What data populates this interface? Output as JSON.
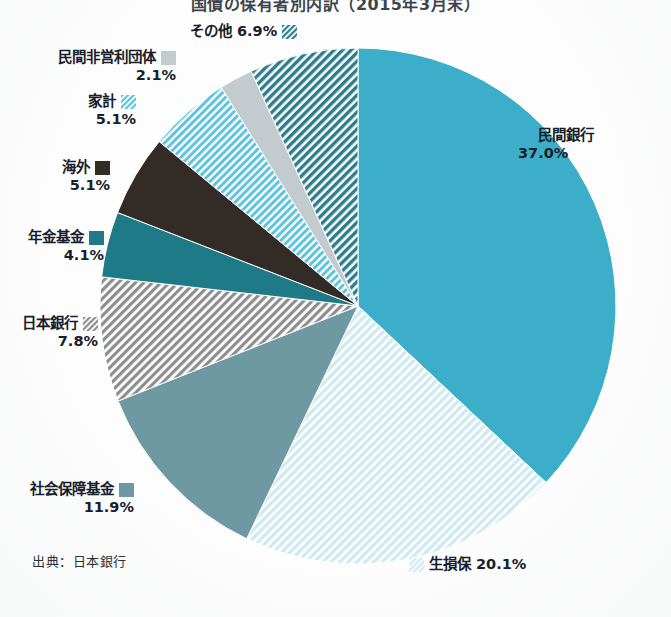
{
  "chart_title": "国債の保有者別内訳（2015年3月末）",
  "source": "出典：日本銀行",
  "colors": {
    "minkan_ginko": "#3CAEC9",
    "seisonpo": "#CFEAF3",
    "shakai_hosho": "#6E99A3",
    "nihon_ginko": "#A8A8A8",
    "nenkin_kikin": "#1F7A88",
    "kaigai": "#332B26",
    "kakei": "#6FC9DF",
    "minkan_hieiri": "#C3CBCE",
    "sonota": "#2E7D8C",
    "text": "#17202A"
  },
  "labels": {
    "sonota": {
      "name": "その他",
      "pct": "6.9%",
      "swatch": "sonota"
    },
    "npo": {
      "name": "民間非営利団体",
      "pct": "2.1%",
      "swatch": "minkan_hieiri"
    },
    "kakei": {
      "name": "家計",
      "pct": "5.1%",
      "swatch": "kakei"
    },
    "kaigai": {
      "name": "海外",
      "pct": "5.1%",
      "swatch": "kaigai"
    },
    "nenkin": {
      "name": "年金基金",
      "pct": "4.1%",
      "swatch": "nenkin_kikin"
    },
    "nichigin": {
      "name": "日本銀行",
      "pct": "7.8%",
      "swatch": "nihon_ginko"
    },
    "shakai": {
      "name": "社会保障基金",
      "pct": "11.9%",
      "swatch": "shakai_hosho"
    },
    "seisonpo": {
      "name": "生損保",
      "pct": "20.1%",
      "swatch": "seisonpo"
    },
    "minkan": {
      "name": "民間銀行",
      "pct": "37.0%",
      "swatch": "minkan_ginko"
    }
  },
  "chart_data": {
    "type": "pie",
    "title": "国債の保有者別内訳（2015年3月末）",
    "source": "出典：日本銀行",
    "unit": "%",
    "legend_position": "around-slices",
    "start_angle_deg": 0,
    "direction": "clockwise",
    "center": {
      "x": 358,
      "y": 306
    },
    "radius": 258,
    "categories": [
      "民間銀行",
      "生損保",
      "社会保障基金",
      "日本銀行",
      "年金基金",
      "海外",
      "家計",
      "民間非営利団体",
      "その他"
    ],
    "values": [
      37.0,
      20.1,
      11.9,
      7.8,
      4.1,
      5.1,
      5.1,
      2.1,
      6.9
    ],
    "slices": [
      {
        "label": "民間銀行",
        "value": 37.0,
        "color": "#3CAEC9",
        "pattern": "solid",
        "start_deg": 0.0,
        "end_deg": 133.2
      },
      {
        "label": "生損保",
        "value": 20.1,
        "color": "#CFEAF3",
        "pattern": "hatch",
        "start_deg": 133.2,
        "end_deg": 205.56
      },
      {
        "label": "社会保障基金",
        "value": 11.9,
        "color": "#6E99A3",
        "pattern": "solid",
        "start_deg": 205.56,
        "end_deg": 248.4
      },
      {
        "label": "日本銀行",
        "value": 7.8,
        "color": "#A8A8A8",
        "pattern": "hatch",
        "start_deg": 248.4,
        "end_deg": 276.48
      },
      {
        "label": "年金基金",
        "value": 4.1,
        "color": "#1F7A88",
        "pattern": "solid",
        "start_deg": 276.48,
        "end_deg": 291.24
      },
      {
        "label": "海外",
        "value": 5.1,
        "color": "#332B26",
        "pattern": "solid",
        "start_deg": 291.24,
        "end_deg": 309.6
      },
      {
        "label": "家計",
        "value": 5.1,
        "color": "#6FC9DF",
        "pattern": "hatch",
        "start_deg": 309.6,
        "end_deg": 327.96
      },
      {
        "label": "民間非営利団体",
        "value": 2.1,
        "color": "#C3CBCE",
        "pattern": "solid",
        "start_deg": 327.96,
        "end_deg": 335.52
      },
      {
        "label": "その他",
        "value": 6.9,
        "color": "#2E7D8C",
        "pattern": "hatch",
        "start_deg": 335.52,
        "end_deg": 360.0
      }
    ]
  }
}
